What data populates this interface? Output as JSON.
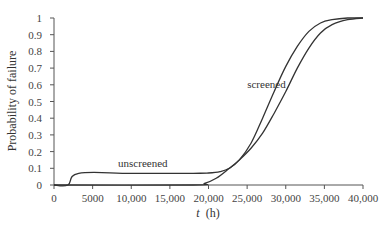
{
  "chart_data": {
    "type": "line",
    "title": "",
    "xlabel": "t (h)",
    "xlabel_italic_part": "t",
    "xlabel_unit": "(h)",
    "ylabel": "Probability of failure",
    "xlim": [
      0,
      40000
    ],
    "ylim": [
      0,
      1
    ],
    "x_ticks": [
      0,
      5000,
      10000,
      15000,
      20000,
      25000,
      30000,
      35000,
      40000
    ],
    "x_tick_labels": [
      "0",
      "5000",
      "10,000",
      "15,000",
      "20,000",
      "25,000",
      "30,000",
      "35,000",
      "40,000"
    ],
    "y_ticks": [
      0,
      0.1,
      0.2,
      0.3,
      0.4,
      0.5,
      0.6,
      0.7,
      0.8,
      0.9,
      1
    ],
    "y_tick_labels": [
      "0",
      "0.1",
      "0.2",
      "0.3",
      "0.4",
      "0.5",
      "0.6",
      "0.7",
      "0.8",
      "0.9",
      "1"
    ],
    "grid": false,
    "legend": "none (curves annotated directly)",
    "series": [
      {
        "name": "unscreened",
        "x": [
          0,
          1800,
          3200,
          10000,
          18000,
          20000,
          21500,
          22700,
          24000,
          25500,
          27000,
          28500,
          30000,
          31500,
          33000,
          34500,
          36000,
          38000,
          40000
        ],
        "y": [
          0,
          0,
          0.07,
          0.07,
          0.07,
          0.072,
          0.08,
          0.1,
          0.15,
          0.25,
          0.4,
          0.56,
          0.71,
          0.83,
          0.92,
          0.97,
          0.99,
          1.0,
          1.0
        ]
      },
      {
        "name": "screened",
        "x": [
          0,
          18000,
          19500,
          21000,
          22700,
          24000,
          25500,
          27000,
          28500,
          30000,
          31500,
          33000,
          34500,
          36000,
          38000,
          40000
        ],
        "y": [
          0,
          0,
          0.01,
          0.04,
          0.1,
          0.15,
          0.22,
          0.31,
          0.43,
          0.56,
          0.7,
          0.82,
          0.91,
          0.96,
          0.99,
          1.0
        ]
      }
    ],
    "annotations": [
      {
        "text": "screened",
        "x": 27500,
        "y": 0.58
      },
      {
        "text": "unscreened",
        "x": 11500,
        "y": 0.11
      }
    ]
  }
}
